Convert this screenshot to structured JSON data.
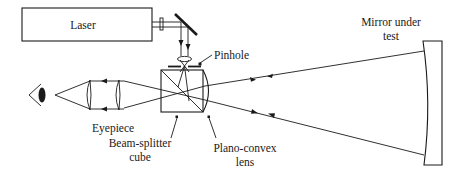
{
  "diagram": {
    "labels": {
      "laser": "Laser",
      "mirror_line1": "Mirror under",
      "mirror_line2": "test",
      "pinhole": "Pinhole",
      "eyepiece": "Eyepiece",
      "beam_splitter_line1": "Beam-splitter",
      "beam_splitter_line2": "cube",
      "plano_convex_line1": "Plano-convex",
      "plano_convex_line2": "lens"
    },
    "components": [
      "eye-icon",
      "eyepiece-lens-pair",
      "beam-splitter-cube",
      "plano-convex-lens",
      "pinhole",
      "focusing-lens",
      "fold-mirror",
      "laser",
      "mirror-under-test"
    ],
    "colors": {
      "ink": "#1a1a1a",
      "background": "#ffffff"
    }
  }
}
